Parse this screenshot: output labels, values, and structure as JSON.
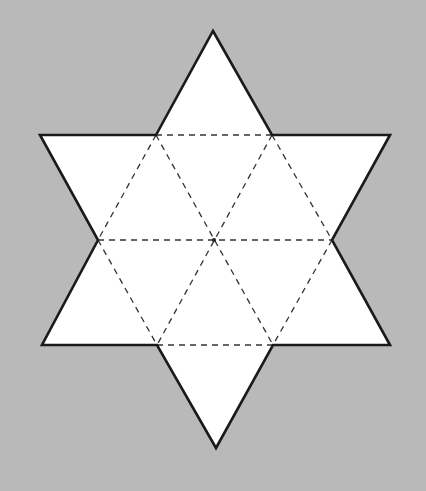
{
  "diagram": {
    "colors": {
      "background": "#b9b9b9",
      "fill": "#ffffff",
      "outline": "#1a1a1a",
      "fold_lines": "#333333"
    },
    "shape": "hexagram",
    "triangle_count": 12,
    "outline_style": "solid",
    "fold_line_style": "dashed",
    "center_dot": true
  }
}
